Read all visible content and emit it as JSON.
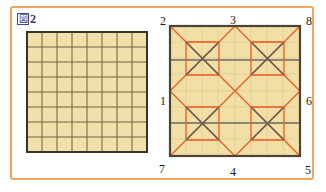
{
  "figure": {
    "caption_box_glyph": "図",
    "caption_number": "2",
    "caption_full": "図2"
  },
  "colors": {
    "frame_orange": "#efa55c",
    "fill_beige": "#f0e0ab",
    "fill_beige_right": "#f1dfa6",
    "grid_line_dark": "#5d5134",
    "grid_border": "#3a3326",
    "pattern_orange": "#e8622a",
    "pattern_gray": "#6a6a66",
    "label_text": "#1b1b1b",
    "caption_blue": "#2e3a73",
    "background": "#ffffff"
  },
  "left_panel": {
    "name": "plain-square-grid",
    "rows": 8,
    "cols": 8,
    "cell_size_px": 15,
    "border_width_px": 2
  },
  "right_panel": {
    "name": "folded-pattern-square",
    "rows": 8,
    "cols": 8,
    "cell_size_px": 16,
    "vertex_labels": [
      {
        "id": "1",
        "text": "1",
        "position": "left-middle"
      },
      {
        "id": "2",
        "text": "2",
        "position": "top-left"
      },
      {
        "id": "3",
        "text": "3",
        "position": "top-middle"
      },
      {
        "id": "4",
        "text": "4",
        "position": "bottom-middle"
      },
      {
        "id": "5",
        "text": "5",
        "position": "bottom-right"
      },
      {
        "id": "6",
        "text": "6",
        "position": "right-middle"
      },
      {
        "id": "7",
        "text": "7",
        "position": "bottom-left"
      },
      {
        "id": "8",
        "text": "8",
        "position": "top-right"
      }
    ],
    "orange_diamonds": 4,
    "x_boxes": 4,
    "horizontal_gray_lines": 2
  }
}
